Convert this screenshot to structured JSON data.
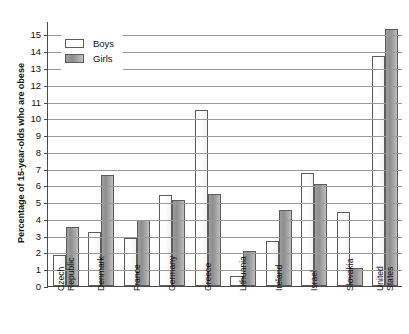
{
  "chart_data": {
    "type": "bar",
    "title": "",
    "xlabel": "",
    "ylabel": "Percentage of 15-year-olds who are obese",
    "ylim": [
      0,
      15.8
    ],
    "yticks": [
      0,
      1,
      2,
      3,
      4,
      5,
      6,
      7,
      8,
      9,
      10,
      11,
      12,
      13,
      14,
      15
    ],
    "grid": true,
    "legend_position": "top-left",
    "categories": [
      "Czech\nRepublic",
      "Denmark",
      "France",
      "Germany",
      "Greece",
      "Lithuania",
      "Ireland",
      "Israel",
      "Slovakia",
      "United\nStates"
    ],
    "series": [
      {
        "name": "Boys",
        "color": "#ffffff",
        "values": [
          1.85,
          3.25,
          2.85,
          5.4,
          10.5,
          0.6,
          2.7,
          6.75,
          4.4,
          13.7
        ]
      },
      {
        "name": "Girls",
        "color": "#9a9a9a",
        "values": [
          3.5,
          6.6,
          3.95,
          5.15,
          5.5,
          2.1,
          4.55,
          6.1,
          1.1,
          15.3
        ]
      }
    ]
  },
  "legend": {
    "items": [
      {
        "label": "Boys"
      },
      {
        "label": "Girls"
      }
    ]
  },
  "axis": {
    "y_title": "Percentage of 15-year-olds who are obese",
    "tick_labels": [
      "0",
      "1",
      "2",
      "3",
      "4",
      "5",
      "6",
      "7",
      "8",
      "9",
      "10",
      "11",
      "12",
      "13",
      "14",
      "15"
    ]
  }
}
